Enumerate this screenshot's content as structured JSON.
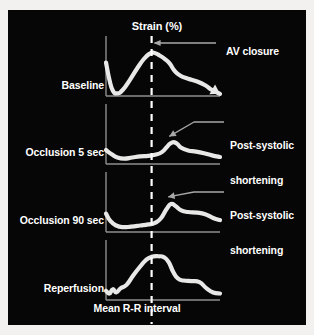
{
  "figure": {
    "background_color": "#060606",
    "trace_color": "#e8e8e6",
    "axis_color": "#8f8f8f",
    "text_color": "#ffffff",
    "title": "Strain (%)",
    "xaxis_label": "Mean R-R interval",
    "annotations": {
      "av_closure": "AV closure",
      "post_systolic_line1": "Post-systolic",
      "post_systolic_line2": "shortening"
    },
    "rows": [
      {
        "label": "Baseline"
      },
      {
        "label": "Occlusion 5 sec"
      },
      {
        "label": "Occlusion 90 sec"
      },
      {
        "label": "Reperfusion"
      }
    ]
  },
  "chart_data": {
    "type": "line",
    "title": "Strain (%)",
    "xlabel": "Mean R-R interval",
    "ylabel": "Strain (%)",
    "grid": false,
    "legend": "none",
    "x_range": [
      0,
      1
    ],
    "y_range": [
      0,
      1
    ],
    "av_closure_x": 0.4,
    "panels": [
      {
        "name": "Baseline",
        "arrow_end": true,
        "points": [
          [
            0.0,
            0.62
          ],
          [
            0.03,
            0.3
          ],
          [
            0.06,
            0.1
          ],
          [
            0.1,
            0.05
          ],
          [
            0.15,
            0.12
          ],
          [
            0.21,
            0.3
          ],
          [
            0.27,
            0.5
          ],
          [
            0.33,
            0.68
          ],
          [
            0.38,
            0.78
          ],
          [
            0.42,
            0.8
          ],
          [
            0.47,
            0.75
          ],
          [
            0.52,
            0.68
          ],
          [
            0.56,
            0.6
          ],
          [
            0.6,
            0.47
          ],
          [
            0.65,
            0.38
          ],
          [
            0.72,
            0.32
          ],
          [
            0.8,
            0.27
          ],
          [
            0.87,
            0.2
          ],
          [
            0.93,
            0.11
          ],
          [
            1.0,
            0.04
          ]
        ]
      },
      {
        "name": "Occlusion 5 sec",
        "arrow_end": false,
        "points": [
          [
            0.0,
            0.26
          ],
          [
            0.05,
            0.18
          ],
          [
            0.1,
            0.12
          ],
          [
            0.16,
            0.1
          ],
          [
            0.23,
            0.12
          ],
          [
            0.3,
            0.14
          ],
          [
            0.37,
            0.15
          ],
          [
            0.43,
            0.17
          ],
          [
            0.49,
            0.22
          ],
          [
            0.54,
            0.33
          ],
          [
            0.58,
            0.4
          ],
          [
            0.62,
            0.38
          ],
          [
            0.66,
            0.3
          ],
          [
            0.72,
            0.25
          ],
          [
            0.79,
            0.23
          ],
          [
            0.86,
            0.2
          ],
          [
            0.93,
            0.16
          ],
          [
            1.0,
            0.13
          ]
        ]
      },
      {
        "name": "Occlusion 90 sec",
        "arrow_end": false,
        "points": [
          [
            0.0,
            0.34
          ],
          [
            0.04,
            0.2
          ],
          [
            0.09,
            0.12
          ],
          [
            0.15,
            0.09
          ],
          [
            0.22,
            0.1
          ],
          [
            0.3,
            0.12
          ],
          [
            0.37,
            0.14
          ],
          [
            0.43,
            0.17
          ],
          [
            0.48,
            0.25
          ],
          [
            0.53,
            0.42
          ],
          [
            0.57,
            0.52
          ],
          [
            0.61,
            0.48
          ],
          [
            0.66,
            0.4
          ],
          [
            0.72,
            0.37
          ],
          [
            0.8,
            0.36
          ],
          [
            0.87,
            0.33
          ],
          [
            0.94,
            0.26
          ],
          [
            1.0,
            0.22
          ]
        ]
      },
      {
        "name": "Reperfusion",
        "arrow_end": false,
        "points": [
          [
            0.0,
            0.17
          ],
          [
            0.03,
            0.12
          ],
          [
            0.06,
            0.2
          ],
          [
            0.09,
            0.14
          ],
          [
            0.13,
            0.22
          ],
          [
            0.18,
            0.28
          ],
          [
            0.24,
            0.46
          ],
          [
            0.3,
            0.62
          ],
          [
            0.35,
            0.74
          ],
          [
            0.4,
            0.8
          ],
          [
            0.46,
            0.81
          ],
          [
            0.51,
            0.79
          ],
          [
            0.55,
            0.7
          ],
          [
            0.59,
            0.52
          ],
          [
            0.63,
            0.4
          ],
          [
            0.68,
            0.36
          ],
          [
            0.75,
            0.35
          ],
          [
            0.82,
            0.33
          ],
          [
            0.88,
            0.22
          ],
          [
            0.94,
            0.14
          ],
          [
            1.0,
            0.12
          ]
        ]
      }
    ]
  }
}
